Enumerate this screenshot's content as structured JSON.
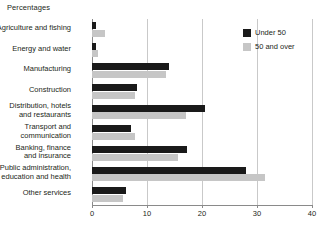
{
  "chart_data": {
    "type": "bar",
    "orientation": "horizontal",
    "title": "Percentages",
    "xlabel": "",
    "ylabel": "",
    "xlim": [
      0,
      40
    ],
    "xticks": [
      0,
      10,
      20,
      30,
      40
    ],
    "grid": true,
    "grid_axis": "x",
    "legend_position": "top-right",
    "categories": [
      "Agriculture and fishing",
      "Energy and water",
      "Manufacturing",
      "Construction",
      "Distribution, hotels and restaurants",
      "Transport and communication",
      "Banking, finance and insurance",
      "Public administration, education and health",
      "Other services"
    ],
    "category_lines": [
      [
        "Agriculture and fishing"
      ],
      [
        "Energy and water"
      ],
      [
        "Manufacturing"
      ],
      [
        "Construction"
      ],
      [
        "Distribution, hotels",
        "and restaurants"
      ],
      [
        "Transport and",
        "communication"
      ],
      [
        "Banking, finance",
        "and insurance"
      ],
      [
        "Public administration,",
        "education and health"
      ],
      [
        "Other services"
      ]
    ],
    "series": [
      {
        "name": "Under 50",
        "color": "#1a1a1a",
        "values": [
          0.8,
          0.8,
          14.0,
          8.2,
          20.6,
          7.1,
          17.3,
          28.0,
          6.2
        ]
      },
      {
        "name": "50 and over",
        "color": "#c6c6c6",
        "values": [
          2.4,
          1.0,
          13.5,
          7.8,
          17.0,
          7.8,
          15.6,
          31.5,
          5.6
        ]
      }
    ]
  },
  "legend": {
    "items": [
      {
        "label": "Under 50",
        "color": "#1a1a1a"
      },
      {
        "label": "50 and over",
        "color": "#c6c6c6"
      }
    ]
  },
  "axis": {
    "tick_labels": [
      "0",
      "10",
      "20",
      "30",
      "40"
    ]
  }
}
